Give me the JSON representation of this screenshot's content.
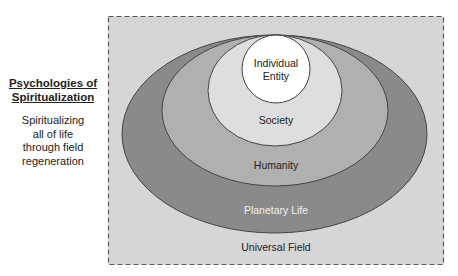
{
  "sidebar": {
    "title_line1": "Psychologies of",
    "title_line2": "Spiritualization",
    "text_lines": [
      "Spiritualizing",
      "all of life",
      "through field",
      "regeneration"
    ]
  },
  "diagram": {
    "type": "nested-ellipses",
    "frame": {
      "style": "dashed",
      "fill": "#d6d6d6",
      "stroke": "#555555"
    },
    "layers": [
      {
        "label": "Universal Field",
        "fill": "#d6d6d6"
      },
      {
        "label": "Planetary Life",
        "fill": "#8a8a8a"
      },
      {
        "label": "Humanity",
        "fill": "#b0b0b0"
      },
      {
        "label": "Society",
        "fill": "#dedede"
      },
      {
        "label_line1": "Individual",
        "label_line2": "Entity",
        "fill": "#ffffff"
      }
    ]
  }
}
